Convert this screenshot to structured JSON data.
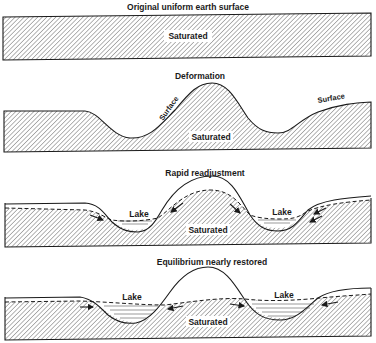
{
  "panels": [
    {
      "title": "Original uniform earth surface",
      "labels": {
        "center": "Saturated"
      }
    },
    {
      "title": "Deformation",
      "labels": {
        "center": "Saturated",
        "surface_left": "Surface",
        "surface_right": "Surface"
      }
    },
    {
      "title": "Rapid readjustment",
      "labels": {
        "center": "Saturated",
        "lake_left": "Lake",
        "lake_right": "Lake"
      }
    },
    {
      "title": "Equilibrium nearly restored",
      "labels": {
        "center": "Saturated",
        "lake_left": "Lake",
        "lake_right": "Lake"
      }
    }
  ],
  "colors": {
    "line": "#1a1a1a",
    "hatch": "#6a6a6a",
    "background": "#ffffff"
  }
}
